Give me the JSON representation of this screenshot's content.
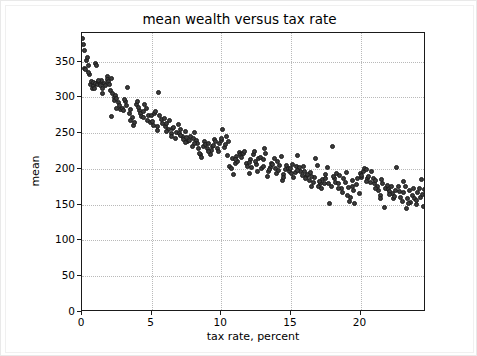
{
  "chart_data": {
    "type": "scatter",
    "title": "mean wealth versus tax rate",
    "xlabel": "tax rate, percent",
    "ylabel": "mean",
    "xlim": [
      0,
      24.7
    ],
    "ylim": [
      0,
      390
    ],
    "grid": true,
    "legend": null,
    "xticks": [
      0,
      5,
      10,
      15,
      20
    ],
    "yticks": [
      0,
      50,
      100,
      150,
      200,
      250,
      300,
      350
    ],
    "xtick_labels": [
      "0",
      "5",
      "10",
      "15",
      "20"
    ],
    "ytick_labels": [
      "0",
      "50",
      "100",
      "150",
      "200",
      "250",
      "300",
      "350"
    ],
    "marker": {
      "shape": "circle",
      "color": "#3b3b3b",
      "edge_color": "#1c1c1c",
      "size_px": 5
    },
    "series": [
      {
        "name": "mean wealth",
        "points": [
          [
            0.05,
            382
          ],
          [
            0.1,
            374
          ],
          [
            0.15,
            366
          ],
          [
            0.2,
            341
          ],
          [
            0.25,
            339
          ],
          [
            0.35,
            352
          ],
          [
            0.4,
            356
          ],
          [
            0.5,
            345
          ],
          [
            0.55,
            332
          ],
          [
            0.6,
            318
          ],
          [
            0.7,
            322
          ],
          [
            0.75,
            313
          ],
          [
            0.8,
            316
          ],
          [
            0.85,
            321
          ],
          [
            0.9,
            312
          ],
          [
            0.95,
            320
          ],
          [
            1.0,
            347
          ],
          [
            1.05,
            345
          ],
          [
            1.1,
            318
          ],
          [
            1.2,
            322
          ],
          [
            1.3,
            319
          ],
          [
            1.35,
            317
          ],
          [
            1.4,
            323
          ],
          [
            1.5,
            306
          ],
          [
            1.6,
            319
          ],
          [
            1.7,
            316
          ],
          [
            1.8,
            329
          ],
          [
            1.85,
            325
          ],
          [
            1.9,
            322
          ],
          [
            2.0,
            318
          ],
          [
            2.05,
            310
          ],
          [
            2.1,
            273
          ],
          [
            2.2,
            305
          ],
          [
            2.3,
            300
          ],
          [
            2.35,
            296
          ],
          [
            2.4,
            303
          ],
          [
            2.5,
            299
          ],
          [
            2.6,
            293
          ],
          [
            2.7,
            288
          ],
          [
            2.8,
            283
          ],
          [
            2.9,
            285
          ],
          [
            3.0,
            281
          ],
          [
            3.1,
            294
          ],
          [
            3.2,
            289
          ],
          [
            3.3,
            314
          ],
          [
            3.4,
            277
          ],
          [
            3.5,
            283
          ],
          [
            3.6,
            272
          ],
          [
            3.7,
            261
          ],
          [
            3.8,
            265
          ],
          [
            3.9,
            290
          ],
          [
            4.0,
            294
          ],
          [
            4.1,
            282
          ],
          [
            4.2,
            278
          ],
          [
            4.3,
            273
          ],
          [
            4.4,
            272
          ],
          [
            4.5,
            290
          ],
          [
            4.6,
            284
          ],
          [
            4.7,
            268
          ],
          [
            4.8,
            275
          ],
          [
            4.9,
            265
          ],
          [
            5.0,
            274
          ],
          [
            5.1,
            261
          ],
          [
            5.2,
            278
          ],
          [
            5.3,
            280
          ],
          [
            5.4,
            259
          ],
          [
            5.5,
            307
          ],
          [
            5.6,
            274
          ],
          [
            5.7,
            269
          ],
          [
            5.8,
            263
          ],
          [
            5.9,
            271
          ],
          [
            6.0,
            259
          ],
          [
            6.1,
            264
          ],
          [
            6.2,
            255
          ],
          [
            6.3,
            267
          ],
          [
            6.4,
            250
          ],
          [
            6.5,
            257
          ],
          [
            6.6,
            258
          ],
          [
            6.7,
            243
          ],
          [
            6.8,
            251
          ],
          [
            6.9,
            262
          ],
          [
            7.0,
            249
          ],
          [
            7.1,
            255
          ],
          [
            7.2,
            246
          ],
          [
            7.3,
            241
          ],
          [
            7.4,
            252
          ],
          [
            7.5,
            244
          ],
          [
            7.6,
            238
          ],
          [
            7.7,
            240
          ],
          [
            7.8,
            246
          ],
          [
            7.9,
            232
          ],
          [
            8.0,
            243
          ],
          [
            8.1,
            251
          ],
          [
            8.2,
            240
          ],
          [
            8.3,
            236
          ],
          [
            8.4,
            228
          ],
          [
            8.5,
            220
          ],
          [
            8.6,
            216
          ],
          [
            8.7,
            232
          ],
          [
            8.8,
            238
          ],
          [
            8.9,
            234
          ],
          [
            9.0,
            229
          ],
          [
            9.1,
            236
          ],
          [
            9.2,
            220
          ],
          [
            9.3,
            226
          ],
          [
            9.4,
            231
          ],
          [
            9.5,
            241
          ],
          [
            9.6,
            238
          ],
          [
            9.7,
            228
          ],
          [
            9.8,
            224
          ],
          [
            9.9,
            236
          ],
          [
            10.0,
            240
          ],
          [
            10.1,
            255
          ],
          [
            10.2,
            230
          ],
          [
            10.3,
            234
          ],
          [
            10.4,
            246
          ],
          [
            10.5,
            239
          ],
          [
            10.6,
            203
          ],
          [
            10.7,
            200
          ],
          [
            10.8,
            214
          ],
          [
            10.9,
            192
          ],
          [
            11.0,
            207
          ],
          [
            11.1,
            218
          ],
          [
            11.2,
            210
          ],
          [
            11.3,
            223
          ],
          [
            11.4,
            220
          ],
          [
            11.5,
            222
          ],
          [
            11.6,
            221
          ],
          [
            11.7,
            224
          ],
          [
            11.8,
            208
          ],
          [
            11.9,
            203
          ],
          [
            12.0,
            194
          ],
          [
            12.1,
            213
          ],
          [
            12.2,
            202
          ],
          [
            12.3,
            220
          ],
          [
            12.4,
            225
          ],
          [
            12.5,
            206
          ],
          [
            12.6,
            197
          ],
          [
            12.7,
            214
          ],
          [
            12.8,
            216
          ],
          [
            12.9,
            200
          ],
          [
            13.0,
            213
          ],
          [
            13.1,
            229
          ],
          [
            13.2,
            222
          ],
          [
            13.3,
            190
          ],
          [
            13.4,
            196
          ],
          [
            13.5,
            202
          ],
          [
            13.6,
            208
          ],
          [
            13.7,
            206
          ],
          [
            13.8,
            215
          ],
          [
            13.9,
            200
          ],
          [
            14.0,
            194
          ],
          [
            14.1,
            198
          ],
          [
            14.2,
            205
          ],
          [
            14.3,
            218
          ],
          [
            14.4,
            184
          ],
          [
            14.5,
            192
          ],
          [
            14.6,
            199
          ],
          [
            14.7,
            205
          ],
          [
            14.8,
            201
          ],
          [
            14.9,
            196
          ],
          [
            15.0,
            200
          ],
          [
            15.1,
            206
          ],
          [
            15.2,
            188
          ],
          [
            15.3,
            195
          ],
          [
            15.4,
            204
          ],
          [
            15.5,
            219
          ],
          [
            15.6,
            202
          ],
          [
            15.7,
            196
          ],
          [
            15.8,
            191
          ],
          [
            15.9,
            203
          ],
          [
            16.0,
            197
          ],
          [
            16.1,
            189
          ],
          [
            16.2,
            192
          ],
          [
            16.3,
            184
          ],
          [
            16.4,
            195
          ],
          [
            16.5,
            176
          ],
          [
            16.6,
            181
          ],
          [
            16.7,
            188
          ],
          [
            16.8,
            214
          ],
          [
            16.9,
            205
          ],
          [
            17.0,
            176
          ],
          [
            17.1,
            180
          ],
          [
            17.2,
            172
          ],
          [
            17.3,
            185
          ],
          [
            17.4,
            180
          ],
          [
            17.5,
            192
          ],
          [
            17.6,
            202
          ],
          [
            17.7,
            179
          ],
          [
            17.8,
            152
          ],
          [
            17.9,
            175
          ],
          [
            18.0,
            232
          ],
          [
            18.1,
            186
          ],
          [
            18.2,
            181
          ],
          [
            18.3,
            194
          ],
          [
            18.4,
            179
          ],
          [
            18.5,
            191
          ],
          [
            18.6,
            172
          ],
          [
            18.7,
            167
          ],
          [
            18.8,
            186
          ],
          [
            18.9,
            181
          ],
          [
            19.0,
            195
          ],
          [
            19.1,
            174
          ],
          [
            19.2,
            154
          ],
          [
            19.3,
            160
          ],
          [
            19.4,
            184
          ],
          [
            19.5,
            170
          ],
          [
            19.6,
            152
          ],
          [
            19.7,
            178
          ],
          [
            19.8,
            187
          ],
          [
            19.9,
            165
          ],
          [
            20.0,
            193
          ],
          [
            20.1,
            188
          ],
          [
            20.2,
            196
          ],
          [
            20.3,
            200
          ],
          [
            20.4,
            199
          ],
          [
            20.5,
            186
          ],
          [
            20.6,
            190
          ],
          [
            20.7,
            181
          ],
          [
            20.8,
            196
          ],
          [
            20.9,
            187
          ],
          [
            21.0,
            179
          ],
          [
            21.1,
            184
          ],
          [
            21.2,
            176
          ],
          [
            21.3,
            170
          ],
          [
            21.4,
            163
          ],
          [
            21.5,
            185
          ],
          [
            21.6,
            180
          ],
          [
            21.7,
            146
          ],
          [
            21.8,
            172
          ],
          [
            21.9,
            177
          ],
          [
            22.0,
            171
          ],
          [
            22.1,
            169
          ],
          [
            22.2,
            176
          ],
          [
            22.3,
            165
          ],
          [
            22.4,
            158
          ],
          [
            22.5,
            170
          ],
          [
            22.6,
            202
          ],
          [
            22.7,
            175
          ],
          [
            22.8,
            168
          ],
          [
            22.9,
            160
          ],
          [
            23.0,
            155
          ],
          [
            23.1,
            182
          ],
          [
            23.2,
            176
          ],
          [
            23.3,
            145
          ],
          [
            23.4,
            159
          ],
          [
            23.5,
            170
          ],
          [
            23.6,
            153
          ],
          [
            23.7,
            163
          ],
          [
            23.8,
            172
          ],
          [
            23.9,
            158
          ],
          [
            24.0,
            150
          ],
          [
            24.1,
            167
          ],
          [
            24.2,
            173
          ],
          [
            24.3,
            160
          ],
          [
            24.4,
            185
          ],
          [
            24.5,
            148
          ],
          [
            24.6,
            171
          ],
          [
            1.15,
            324
          ],
          [
            2.15,
            327
          ],
          [
            3.05,
            297
          ],
          [
            4.05,
            286
          ],
          [
            5.05,
            266
          ],
          [
            6.05,
            252
          ],
          [
            7.05,
            247
          ],
          [
            8.05,
            235
          ],
          [
            9.05,
            225
          ],
          [
            10.05,
            243
          ],
          [
            11.05,
            213
          ],
          [
            12.05,
            209
          ],
          [
            13.05,
            204
          ],
          [
            14.05,
            210
          ],
          [
            15.05,
            193
          ],
          [
            16.05,
            186
          ],
          [
            17.05,
            183
          ],
          [
            18.05,
            190
          ],
          [
            19.05,
            163
          ],
          [
            20.05,
            191
          ],
          [
            21.05,
            172
          ],
          [
            22.05,
            164
          ],
          [
            23.05,
            167
          ],
          [
            24.05,
            156
          ],
          [
            0.45,
            335
          ],
          [
            1.45,
            313
          ],
          [
            2.45,
            284
          ],
          [
            3.45,
            268
          ],
          [
            4.45,
            280
          ],
          [
            5.45,
            254
          ],
          [
            6.45,
            245
          ],
          [
            7.45,
            237
          ],
          [
            8.45,
            222
          ],
          [
            9.45,
            233
          ],
          [
            10.45,
            219
          ],
          [
            11.45,
            216
          ],
          [
            12.45,
            211
          ],
          [
            13.45,
            199
          ],
          [
            14.45,
            188
          ],
          [
            15.45,
            198
          ],
          [
            16.45,
            190
          ],
          [
            17.45,
            186
          ],
          [
            18.45,
            173
          ],
          [
            19.45,
            176
          ],
          [
            20.45,
            183
          ],
          [
            21.45,
            159
          ],
          [
            22.45,
            162
          ],
          [
            23.45,
            151
          ],
          [
            24.45,
            164
          ]
        ]
      }
    ]
  }
}
